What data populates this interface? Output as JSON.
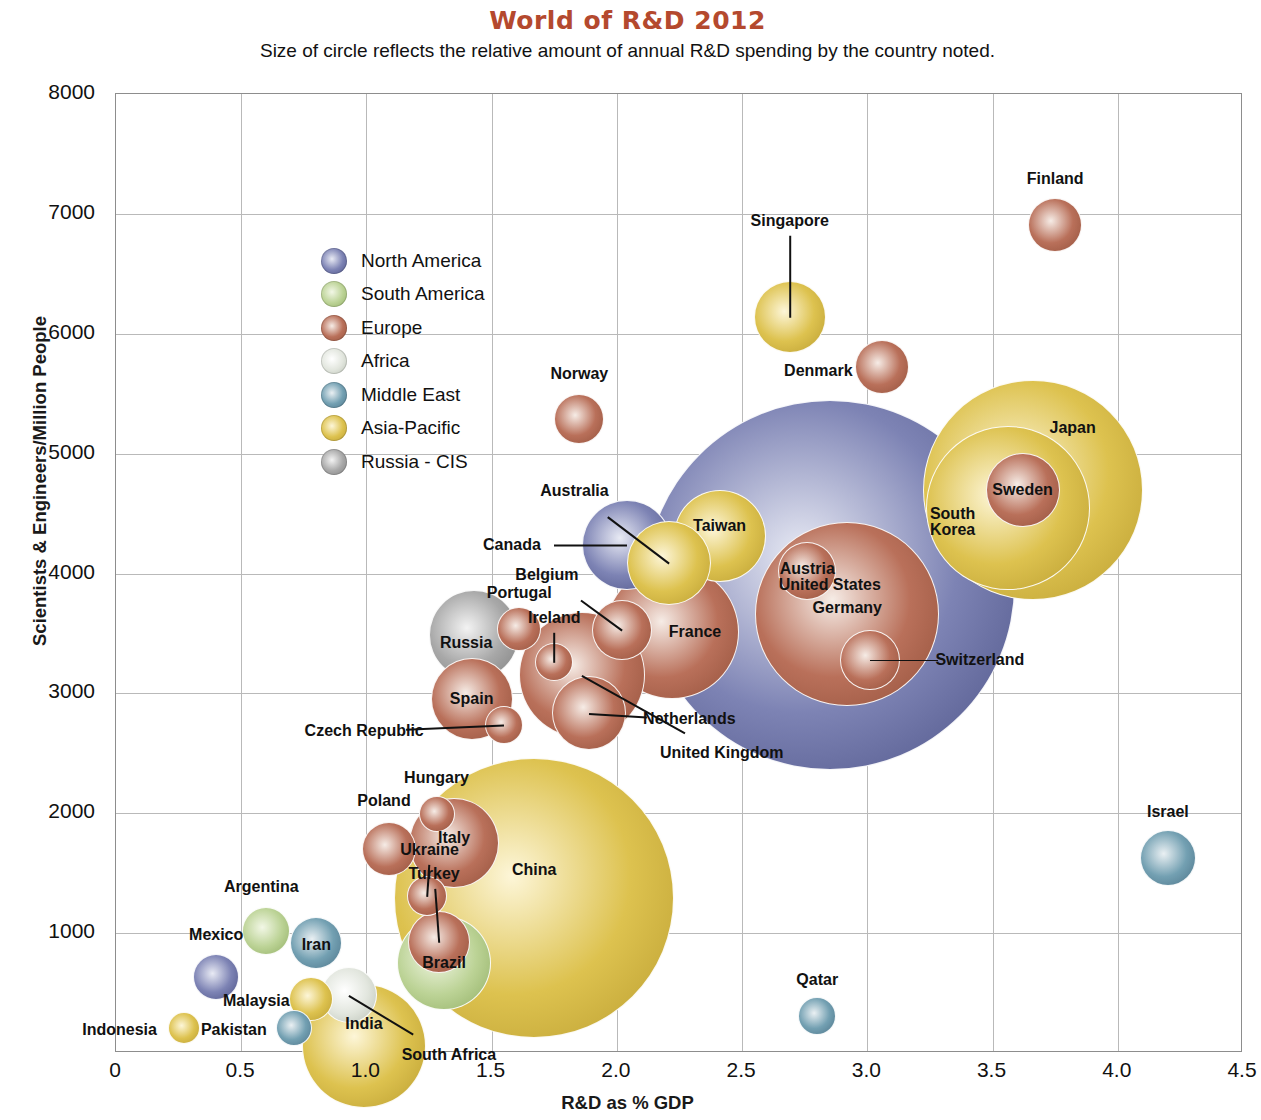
{
  "header": {
    "title": "World of R&D 2012",
    "subtitle": "Size of circle reflects the relative amount of annual R&D spending by the country noted.",
    "title_color": "#B4492E"
  },
  "legend": {
    "position": "inside-top-left",
    "items": [
      {
        "label": "North America",
        "color": "#6b71a8"
      },
      {
        "label": "South America",
        "color": "#b7ce8e"
      },
      {
        "label": "Europe",
        "color": "#b0654a"
      },
      {
        "label": "Africa",
        "color": "#dfe3da"
      },
      {
        "label": "Middle East",
        "color": "#6a93a5"
      },
      {
        "label": "Asia-Pacific",
        "color": "#ddc04b"
      },
      {
        "label": "Russia - CIS",
        "color": "#9c9c9c"
      }
    ]
  },
  "chart_data": {
    "type": "scatter",
    "title": "World of R&D 2012",
    "subtitle": "Size of circle reflects the relative amount of annual R&D spending by the country noted.",
    "xlabel": "R&D as % GDP",
    "ylabel": "Scientists & Engineers/Million People",
    "xlim": [
      0,
      4.5
    ],
    "ylim": [
      0,
      8000
    ],
    "xticks": [
      "0",
      "0.5",
      "1.0",
      "1.5",
      "2.0",
      "2.5",
      "3.0",
      "3.5",
      "4.0",
      "4.5"
    ],
    "xtick_values": [
      0,
      0.5,
      1.0,
      1.5,
      2.0,
      2.5,
      3.0,
      3.5,
      4.0,
      4.5
    ],
    "yticks": [
      "1000",
      "2000",
      "3000",
      "4000",
      "5000",
      "6000",
      "7000",
      "8000"
    ],
    "ytick_values": [
      1000,
      2000,
      3000,
      4000,
      5000,
      6000,
      7000,
      8000
    ],
    "grid": true,
    "size_meaning": "Circle area is proportional to annual R&D spending",
    "groups": [
      "North America",
      "South America",
      "Europe",
      "Africa",
      "Middle East",
      "Asia-Pacific",
      "Russia - CIS"
    ],
    "points": [
      {
        "name": "United States",
        "x": 2.85,
        "y": 3900,
        "r": 185,
        "group": "North America",
        "label_dx": 0,
        "label_dy": 0,
        "leader": false
      },
      {
        "name": "Japan",
        "x": 3.66,
        "y": 4700,
        "r": 110,
        "group": "Asia-Pacific",
        "label_dx": 40,
        "label_dy": -62,
        "leader": false
      },
      {
        "name": "South Korea",
        "x": 3.56,
        "y": 4550,
        "r": 82,
        "group": "Asia-Pacific",
        "label_dx": -55,
        "label_dy": 15,
        "leader": false
      },
      {
        "name": "China",
        "x": 1.67,
        "y": 1290,
        "r": 140,
        "group": "Asia-Pacific",
        "label_dx": 0,
        "label_dy": -28,
        "leader": false
      },
      {
        "name": "Germany",
        "x": 2.92,
        "y": 3660,
        "r": 92,
        "group": "Europe",
        "label_dx": 0,
        "label_dy": -6,
        "leader": false
      },
      {
        "name": "Finland",
        "x": 3.75,
        "y": 6910,
        "r": 27,
        "group": "Europe",
        "label_dx": 0,
        "label_dy": -46,
        "leader": false
      },
      {
        "name": "Sweden",
        "x": 3.62,
        "y": 4700,
        "r": 37,
        "group": "Europe",
        "label_dx": 0,
        "label_dy": 0,
        "leader": false
      },
      {
        "name": "Denmark",
        "x": 3.06,
        "y": 5720,
        "r": 27,
        "group": "Europe",
        "label_dx": -64,
        "label_dy": 4,
        "leader": false
      },
      {
        "name": "Singapore",
        "x": 2.69,
        "y": 6140,
        "r": 36,
        "group": "Asia-Pacific",
        "label_dx": 0,
        "label_dy": -96,
        "leader": true
      },
      {
        "name": "Norway",
        "x": 1.85,
        "y": 5290,
        "r": 25,
        "group": "Europe",
        "label_dx": 0,
        "label_dy": -45,
        "leader": false
      },
      {
        "name": "Israel",
        "x": 4.2,
        "y": 1630,
        "r": 28,
        "group": "Middle East",
        "label_dx": 0,
        "label_dy": -46,
        "leader": false
      },
      {
        "name": "Qatar",
        "x": 2.8,
        "y": 310,
        "r": 19,
        "group": "Middle East",
        "label_dx": 0,
        "label_dy": -36,
        "leader": false
      },
      {
        "name": "Taiwan",
        "x": 2.41,
        "y": 4310,
        "r": 46,
        "group": "Asia-Pacific",
        "label_dx": 0,
        "label_dy": -10,
        "leader": false
      },
      {
        "name": "Canada",
        "x": 2.04,
        "y": 4240,
        "r": 45,
        "group": "North America",
        "label_dx": -115,
        "label_dy": 0,
        "leader": true
      },
      {
        "name": "Australia",
        "x": 2.21,
        "y": 4090,
        "r": 42,
        "group": "Asia-Pacific",
        "label_dx": -95,
        "label_dy": -72,
        "leader": true
      },
      {
        "name": "France",
        "x": 2.22,
        "y": 3510,
        "r": 67,
        "group": "Europe",
        "label_dx": 23,
        "label_dy": 0,
        "leader": false
      },
      {
        "name": "United Kingdom",
        "x": 1.86,
        "y": 3150,
        "r": 63,
        "group": "Europe",
        "label_dx": 140,
        "label_dy": 78,
        "leader": true
      },
      {
        "name": "Netherlands",
        "x": 1.89,
        "y": 2840,
        "r": 37,
        "group": "Europe",
        "label_dx": 100,
        "label_dy": 6,
        "leader": true
      },
      {
        "name": "Belgium",
        "x": 2.02,
        "y": 3530,
        "r": 30,
        "group": "Europe",
        "label_dx": -75,
        "label_dy": -55,
        "leader": true
      },
      {
        "name": "Austria",
        "x": 2.76,
        "y": 4020,
        "r": 29,
        "group": "Europe",
        "label_dx": 0,
        "label_dy": -2,
        "leader": false
      },
      {
        "name": "Switzerland",
        "x": 3.01,
        "y": 3280,
        "r": 30,
        "group": "Europe",
        "label_dx": 110,
        "label_dy": 0,
        "leader": true
      },
      {
        "name": "Ireland",
        "x": 1.75,
        "y": 3260,
        "r": 19,
        "group": "Europe",
        "label_dx": 0,
        "label_dy": -44,
        "leader": true
      },
      {
        "name": "Spain",
        "x": 1.42,
        "y": 2950,
        "r": 41,
        "group": "Europe",
        "label_dx": 0,
        "label_dy": 0,
        "leader": false
      },
      {
        "name": "Czech Republic",
        "x": 1.55,
        "y": 2740,
        "r": 19,
        "group": "Europe",
        "label_dx": -140,
        "label_dy": 6,
        "leader": true
      },
      {
        "name": "Portugal",
        "x": 1.61,
        "y": 3540,
        "r": 22,
        "group": "Europe",
        "label_dx": 0,
        "label_dy": -36,
        "leader": false
      },
      {
        "name": "Russia",
        "x": 1.43,
        "y": 3490,
        "r": 45,
        "group": "Russia - CIS",
        "label_dx": -8,
        "label_dy": 8,
        "leader": false
      },
      {
        "name": "Italy",
        "x": 1.35,
        "y": 1750,
        "r": 45,
        "group": "Europe",
        "label_dx": 0,
        "label_dy": -5,
        "leader": false
      },
      {
        "name": "Hungary",
        "x": 1.28,
        "y": 1990,
        "r": 18,
        "group": "Europe",
        "label_dx": 0,
        "label_dy": -36,
        "leader": false
      },
      {
        "name": "Poland",
        "x": 1.09,
        "y": 1700,
        "r": 27,
        "group": "Europe",
        "label_dx": -5,
        "label_dy": -48,
        "leader": false
      },
      {
        "name": "Ukraine",
        "x": 1.24,
        "y": 1310,
        "r": 20,
        "group": "Europe",
        "label_dx": 3,
        "label_dy": -46,
        "leader": true
      },
      {
        "name": "Turkey",
        "x": 1.29,
        "y": 930,
        "r": 31,
        "group": "Europe",
        "label_dx": -5,
        "label_dy": -68,
        "leader": true
      },
      {
        "name": "Brazil",
        "x": 1.31,
        "y": 750,
        "r": 47,
        "group": "South America",
        "label_dx": 0,
        "label_dy": 0,
        "leader": false
      },
      {
        "name": "Argentina",
        "x": 0.6,
        "y": 1020,
        "r": 24,
        "group": "South America",
        "label_dx": -5,
        "label_dy": -44,
        "leader": false
      },
      {
        "name": "Iran",
        "x": 0.8,
        "y": 920,
        "r": 26,
        "group": "Middle East",
        "label_dx": 0,
        "label_dy": 2,
        "leader": false
      },
      {
        "name": "Mexico",
        "x": 0.4,
        "y": 630,
        "r": 23,
        "group": "North America",
        "label_dx": 0,
        "label_dy": -42,
        "leader": false
      },
      {
        "name": "Malaysia",
        "x": 0.78,
        "y": 450,
        "r": 22,
        "group": "Asia-Pacific",
        "label_dx": -55,
        "label_dy": 2,
        "leader": false
      },
      {
        "name": "Pakistan",
        "x": 0.71,
        "y": 210,
        "r": 18,
        "group": "Middle East",
        "label_dx": -60,
        "label_dy": 2,
        "leader": false
      },
      {
        "name": "Indonesia",
        "x": 0.27,
        "y": 210,
        "r": 16,
        "group": "Asia-Pacific",
        "label_dx": -64,
        "label_dy": 2,
        "leader": false
      },
      {
        "name": "India",
        "x": 0.99,
        "y": 60,
        "r": 62,
        "group": "Asia-Pacific",
        "label_dx": 0,
        "label_dy": -22,
        "leader": false
      },
      {
        "name": "South Africa",
        "x": 0.93,
        "y": 480,
        "r": 28,
        "group": "Africa",
        "label_dx": 100,
        "label_dy": 60,
        "leader": true
      }
    ]
  }
}
